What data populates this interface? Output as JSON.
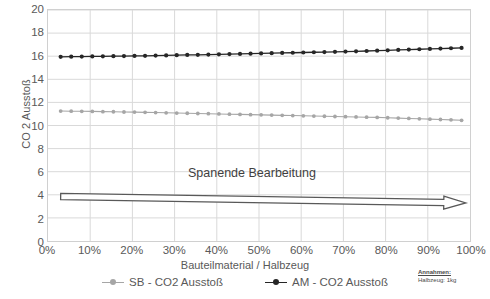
{
  "chart_data": {
    "type": "line",
    "title": "",
    "xlabel": "Bauteilmaterial / Halbzeug",
    "ylabel": "CO 2 Ausstoß",
    "xlim": [
      0,
      100
    ],
    "ylim": [
      0,
      20
    ],
    "ytick_step": 2,
    "xtick_step": 10,
    "grid": true,
    "legend_position": "bottom",
    "x_tick_labels": [
      "0%",
      "10%",
      "20%",
      "30%",
      "40%",
      "50%",
      "60%",
      "70%",
      "80%",
      "90%",
      "100%"
    ],
    "y_tick_labels": [
      "0",
      "2",
      "4",
      "6",
      "8",
      "10",
      "12",
      "14",
      "16",
      "18",
      "20"
    ],
    "x": [
      3,
      5.5,
      8,
      10.5,
      13,
      15.5,
      18,
      20.5,
      23,
      25.5,
      28,
      30.5,
      33,
      35.5,
      38,
      40.5,
      43,
      45.5,
      48,
      50.5,
      53,
      55.5,
      58,
      60.5,
      63,
      65.5,
      68,
      70.5,
      73,
      75.5,
      78,
      80.5,
      83,
      85.5,
      88,
      90.5,
      93,
      95.5,
      98
    ],
    "series": [
      {
        "name": "SB - CO2 Ausstoß",
        "color": "#a6a6a6",
        "marker": "circle",
        "values": [
          11.25,
          11.24,
          11.23,
          11.22,
          11.2,
          11.19,
          11.17,
          11.16,
          11.14,
          11.12,
          11.1,
          11.08,
          11.06,
          11.04,
          11.02,
          11.0,
          10.98,
          10.96,
          10.94,
          10.92,
          10.9,
          10.88,
          10.86,
          10.84,
          10.82,
          10.8,
          10.78,
          10.76,
          10.74,
          10.72,
          10.7,
          10.67,
          10.64,
          10.61,
          10.58,
          10.55,
          10.52,
          10.49,
          10.45
        ]
      },
      {
        "name": "AM - CO2 Ausstoß",
        "color": "#262626",
        "marker": "circle",
        "values": [
          15.95,
          15.96,
          15.97,
          15.98,
          15.99,
          16.0,
          16.01,
          16.02,
          16.03,
          16.05,
          16.07,
          16.09,
          16.11,
          16.12,
          16.14,
          16.16,
          16.18,
          16.2,
          16.22,
          16.24,
          16.26,
          16.28,
          16.3,
          16.32,
          16.34,
          16.36,
          16.38,
          16.4,
          16.42,
          16.45,
          16.48,
          16.51,
          16.54,
          16.57,
          16.6,
          16.63,
          16.66,
          16.69,
          16.72
        ]
      }
    ],
    "annotations": [
      {
        "name": "spanende-bearbeitung-arrow",
        "label": "Spanende Bearbeitung",
        "shape": "block-arrow-right",
        "x_start": 3,
        "x_end": 99,
        "y_start": 3.85,
        "y_end": 3.3
      }
    ],
    "notes": {
      "title": "Annahmen:",
      "body": "Halbzeug: 1kg"
    }
  },
  "colors": {
    "series_sb": "#a6a6a6",
    "series_am": "#262626",
    "grid": "#d9d9d9",
    "axis_text": "#595959",
    "plot_border": "#d0d0d0",
    "arrow_stroke": "#595959",
    "background": "#ffffff"
  }
}
